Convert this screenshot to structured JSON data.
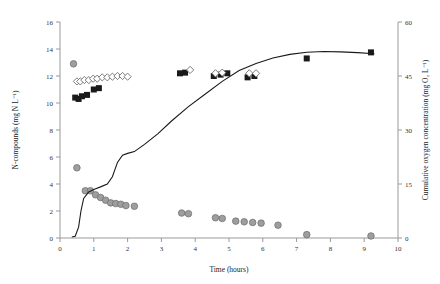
{
  "chart_data": {
    "type": "scatter",
    "title": "",
    "xlabel": "Time (hours)",
    "ylabel": "N-compounds (mg N L⁻¹)",
    "y2label": "Cumulative oxygen concentration (mg O₂ L⁻¹)",
    "xlim": [
      0,
      10
    ],
    "ylim": [
      0,
      16
    ],
    "y2lim": [
      0,
      60
    ],
    "xticks": [
      0,
      1,
      2,
      3,
      4,
      5,
      6,
      7,
      8,
      9,
      10
    ],
    "yticks": [
      0,
      2,
      4,
      6,
      8,
      10,
      12,
      14,
      16
    ],
    "y2ticks": [
      0,
      15,
      30,
      45,
      60
    ],
    "grid": false,
    "legend": "none",
    "series": [
      {
        "name": "filled-squares",
        "marker": "square",
        "color": "#1a1a1a",
        "axis": "left",
        "points": [
          [
            0.45,
            10.4
          ],
          [
            0.55,
            10.3
          ],
          [
            0.65,
            10.5
          ],
          [
            0.8,
            10.6
          ],
          [
            1.0,
            11.0
          ],
          [
            1.15,
            11.1
          ],
          [
            3.55,
            12.2
          ],
          [
            3.7,
            12.25
          ],
          [
            4.55,
            12.0
          ],
          [
            4.75,
            12.1
          ],
          [
            4.95,
            12.2
          ],
          [
            5.55,
            11.9
          ],
          [
            5.75,
            12.0
          ],
          [
            7.3,
            13.3
          ],
          [
            9.2,
            13.75
          ]
        ]
      },
      {
        "name": "open-diamonds",
        "marker": "diamond",
        "color": "#6f6f6f",
        "axis": "left",
        "points": [
          [
            0.5,
            11.6
          ],
          [
            0.6,
            11.6
          ],
          [
            0.72,
            11.7
          ],
          [
            0.85,
            11.7
          ],
          [
            0.98,
            11.8
          ],
          [
            1.1,
            11.8
          ],
          [
            1.25,
            11.9
          ],
          [
            1.4,
            11.9
          ],
          [
            1.55,
            11.95
          ],
          [
            1.7,
            12.0
          ],
          [
            1.85,
            12.0
          ],
          [
            2.0,
            11.95
          ],
          [
            3.85,
            12.45
          ],
          [
            4.6,
            12.2
          ],
          [
            4.8,
            12.25
          ],
          [
            5.6,
            12.2
          ],
          [
            5.8,
            12.2
          ]
        ]
      },
      {
        "name": "grey-circles",
        "marker": "circle",
        "color": "#9e9e9e",
        "axis": "left",
        "points": [
          [
            0.4,
            12.9
          ],
          [
            0.5,
            5.2
          ],
          [
            0.75,
            3.5
          ],
          [
            0.9,
            3.5
          ],
          [
            1.05,
            3.2
          ],
          [
            1.2,
            3.0
          ],
          [
            1.35,
            2.8
          ],
          [
            1.5,
            2.6
          ],
          [
            1.65,
            2.55
          ],
          [
            1.8,
            2.5
          ],
          [
            1.95,
            2.4
          ],
          [
            2.2,
            2.35
          ],
          [
            3.6,
            1.85
          ],
          [
            3.8,
            1.8
          ],
          [
            4.6,
            1.5
          ],
          [
            4.8,
            1.45
          ],
          [
            5.2,
            1.25
          ],
          [
            5.45,
            1.2
          ],
          [
            5.7,
            1.15
          ],
          [
            5.95,
            1.1
          ],
          [
            6.45,
            0.95
          ],
          [
            7.3,
            0.25
          ],
          [
            9.2,
            0.15
          ]
        ]
      },
      {
        "name": "cumulative-oxygen-line",
        "marker": "line",
        "color": "#1a1a1a",
        "axis": "right",
        "points": [
          [
            0.35,
            0.3
          ],
          [
            0.45,
            0.5
          ],
          [
            0.55,
            3.0
          ],
          [
            0.62,
            7.5
          ],
          [
            0.7,
            11.0
          ],
          [
            0.85,
            12.8
          ],
          [
            1.0,
            13.5
          ],
          [
            1.2,
            14.2
          ],
          [
            1.4,
            15.0
          ],
          [
            1.55,
            17.0
          ],
          [
            1.7,
            21.0
          ],
          [
            1.85,
            23.0
          ],
          [
            2.0,
            23.5
          ],
          [
            2.2,
            24.0
          ],
          [
            2.5,
            26.0
          ],
          [
            2.9,
            29.0
          ],
          [
            3.3,
            32.5
          ],
          [
            3.8,
            36.5
          ],
          [
            4.3,
            40.0
          ],
          [
            4.8,
            43.5
          ],
          [
            5.3,
            46.5
          ],
          [
            5.8,
            48.5
          ],
          [
            6.3,
            50.0
          ],
          [
            6.8,
            51.0
          ],
          [
            7.3,
            51.6
          ],
          [
            7.8,
            51.8
          ],
          [
            8.3,
            51.7
          ],
          [
            8.8,
            51.5
          ],
          [
            9.3,
            51.2
          ]
        ]
      }
    ]
  }
}
